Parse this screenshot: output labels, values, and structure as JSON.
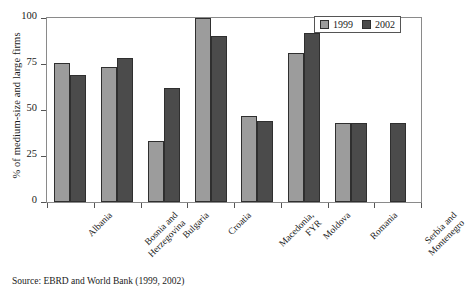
{
  "chart_data": {
    "type": "bar",
    "title": "",
    "xlabel": "",
    "ylabel": "% of medium-size and large firms",
    "ylim": [
      0,
      100
    ],
    "yticks": [
      0,
      25,
      50,
      75,
      100
    ],
    "ytick_labels": [
      "0",
      "25",
      "50",
      "75",
      "100"
    ],
    "grid": false,
    "legend_position": "top-right",
    "categories": [
      "Albania",
      "Bosnia and Herzegovina",
      "Bulgaria",
      "Croatia",
      "Macedonia, FYR",
      "Moldova",
      "Romania",
      "Serbia and Montenegro"
    ],
    "category_lines": [
      [
        "Albania"
      ],
      [
        "Bosnia and",
        "Herzegovina"
      ],
      [
        "Bulgaria"
      ],
      [
        "Croatia"
      ],
      [
        "Macedonia,",
        "FYR"
      ],
      [
        "Moldova"
      ],
      [
        "Romania"
      ],
      [
        "Serbia and",
        "Montenegro"
      ]
    ],
    "series": [
      {
        "name": "1999",
        "color": "#9c9c9c",
        "values": [
          75.5,
          73.5,
          33,
          100,
          47,
          81,
          43,
          null
        ]
      },
      {
        "name": "2002",
        "color": "#4b4b4b",
        "values": [
          69,
          78,
          62,
          90,
          44,
          92,
          43,
          43
        ]
      }
    ]
  },
  "legend": {
    "entries": [
      {
        "label": "1999"
      },
      {
        "label": "2002"
      }
    ]
  },
  "source": {
    "text": "Source: EBRD and World Bank (1999, 2002)"
  }
}
